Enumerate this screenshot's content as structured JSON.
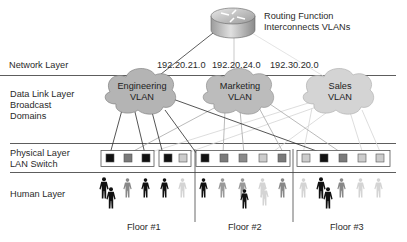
{
  "router": {
    "icon": "router-icon",
    "label_line1": "Routing Function",
    "label_line2": "Interconnects VLANs"
  },
  "layers": {
    "network": "Network Layer",
    "datalink_line1": "Data Link Layer",
    "datalink_line2": "Broadcast",
    "datalink_line3": "Domains",
    "physical_line1": "Physical Layer",
    "physical_line2": "LAN Switch",
    "human": "Human Layer"
  },
  "subnets": [
    "192.20.21.0",
    "192.20.24.0",
    "192.30.20.0"
  ],
  "vlans": [
    {
      "line1": "Engineering",
      "line2": "VLAN",
      "shade": "#b4b4b4",
      "line_color": "#333333"
    },
    {
      "line1": "Marketing",
      "line2": "VLAN",
      "shade": "#b9b9b9",
      "line_color": "#9a9a9a"
    },
    {
      "line1": "Sales",
      "line2": "VLAN",
      "shade": "#d2d2d2",
      "line_color": "#cfcfcf"
    }
  ],
  "switches": [
    {
      "ports": [
        "eng",
        "mkt",
        "eng"
      ]
    },
    {
      "ports": [
        "eng",
        "sales"
      ]
    },
    {
      "ports": [
        "eng",
        "mkt",
        "mkt",
        "sales",
        "mkt"
      ]
    },
    {
      "ports": [
        "sales",
        "eng",
        "mkt",
        "sales",
        "sales"
      ]
    }
  ],
  "port_colors": {
    "eng": "#111111",
    "mkt": "#7a7a7a",
    "sales": "#cccccc"
  },
  "floors": [
    "Floor #1",
    "Floor #2",
    "Floor #3"
  ]
}
